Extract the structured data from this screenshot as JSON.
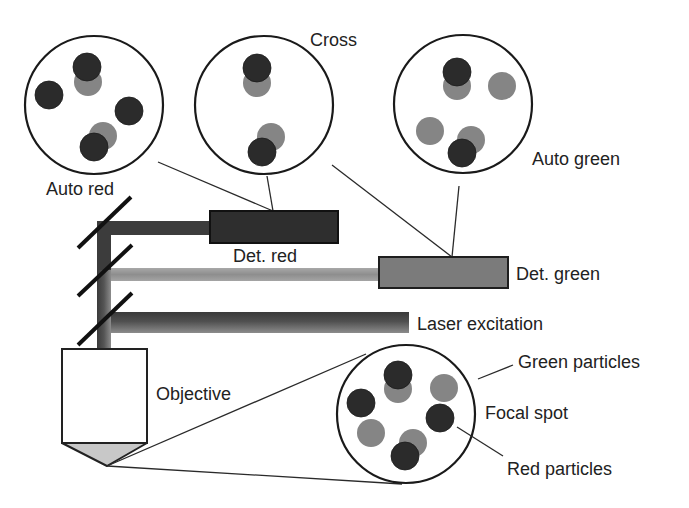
{
  "labels": {
    "cross": "Cross",
    "auto_red": "Auto red",
    "auto_green": "Auto green",
    "det_red": "Det. red",
    "det_green": "Det. green",
    "laser_excitation": "Laser excitation",
    "objective": "Objective",
    "green_particles": "Green particles",
    "focal_spot": "Focal spot",
    "red_particles": "Red particles"
  },
  "colors": {
    "red_particle": "#2b2b2b",
    "green_particle": "#858585",
    "red_beam": "#3c3c3c",
    "green_beam": "#9a9a9a",
    "det_red": "#2e2e2e",
    "det_green": "#7b7b7b"
  },
  "views": {
    "auto_red": {
      "particles": [
        {
          "type": "green",
          "x": 88,
          "y": 82
        },
        {
          "type": "red",
          "x": 87,
          "y": 67
        },
        {
          "type": "red",
          "x": 49,
          "y": 95
        },
        {
          "type": "red",
          "x": 129,
          "y": 111
        },
        {
          "type": "green",
          "x": 103,
          "y": 136
        },
        {
          "type": "red",
          "x": 94,
          "y": 147
        }
      ]
    },
    "cross": {
      "particles": [
        {
          "type": "green",
          "x": 257,
          "y": 83
        },
        {
          "type": "red",
          "x": 257,
          "y": 68
        },
        {
          "type": "green",
          "x": 271,
          "y": 137
        },
        {
          "type": "red",
          "x": 262,
          "y": 152
        }
      ]
    },
    "auto_green": {
      "particles": [
        {
          "type": "green",
          "x": 457,
          "y": 86
        },
        {
          "type": "red",
          "x": 457,
          "y": 72
        },
        {
          "type": "green",
          "x": 502,
          "y": 86
        },
        {
          "type": "green",
          "x": 430,
          "y": 131
        },
        {
          "type": "green",
          "x": 471,
          "y": 140
        },
        {
          "type": "red",
          "x": 462,
          "y": 153
        }
      ]
    },
    "focal_spot": {
      "particles": [
        {
          "type": "green",
          "x": 398,
          "y": 389
        },
        {
          "type": "red",
          "x": 398,
          "y": 375
        },
        {
          "type": "green",
          "x": 444,
          "y": 388
        },
        {
          "type": "red",
          "x": 361,
          "y": 403
        },
        {
          "type": "red",
          "x": 440,
          "y": 418
        },
        {
          "type": "green",
          "x": 371,
          "y": 433
        },
        {
          "type": "green",
          "x": 413,
          "y": 443
        },
        {
          "type": "red",
          "x": 405,
          "y": 456
        }
      ]
    }
  }
}
